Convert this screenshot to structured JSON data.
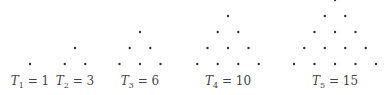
{
  "figure": {
    "items": [
      {
        "symbol": "T",
        "index": "1",
        "value": "1",
        "rows": 1,
        "cx": 30
      },
      {
        "symbol": "T",
        "index": "2",
        "value": "3",
        "rows": 2,
        "cx": 75
      },
      {
        "symbol": "T",
        "index": "3",
        "value": "6",
        "rows": 3,
        "cx": 140
      },
      {
        "symbol": "T",
        "index": "4",
        "value": "10",
        "rows": 4,
        "cx": 228
      },
      {
        "symbol": "T",
        "index": "5",
        "value": "15",
        "rows": 5,
        "cx": 335
      }
    ],
    "dot_color": "#333333",
    "eq_sign": "="
  }
}
